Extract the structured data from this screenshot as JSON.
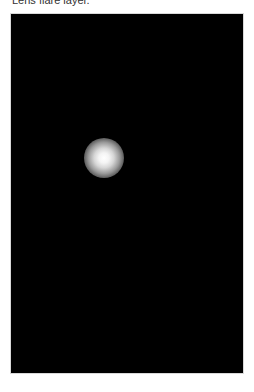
{
  "caption": {
    "text": "Lens flare layer."
  },
  "canvas": {
    "background_color": "#000000",
    "flare": {
      "icon": "light-glow",
      "color": "#ffffff"
    }
  }
}
